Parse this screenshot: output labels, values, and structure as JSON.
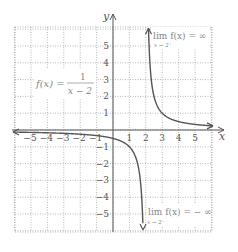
{
  "chart_data": {
    "type": "line",
    "title": "",
    "function": "f(x) = 1/(x-2)",
    "xlabel": "x",
    "ylabel": "y",
    "xlim": [
      -6,
      6
    ],
    "ylim": [
      -6,
      6
    ],
    "grid": true,
    "x_ticks": [
      -5,
      -4,
      -3,
      -2,
      -1,
      1,
      2,
      3,
      4,
      5
    ],
    "y_ticks": [
      -5,
      -4,
      -3,
      -2,
      -1,
      1,
      2,
      3,
      4,
      5
    ],
    "vertical_asymptote": 2,
    "horizontal_asymptote": 0,
    "series": [
      {
        "name": "left branch (x < 2)",
        "x": [
          -6,
          -5,
          -4,
          -3,
          -2,
          -1,
          0,
          1,
          1.5,
          1.8,
          1.83
        ],
        "y": [
          -0.125,
          -0.143,
          -0.167,
          -0.2,
          -0.25,
          -0.333,
          -0.5,
          -1,
          -2,
          -5,
          -6
        ]
      },
      {
        "name": "right branch (x > 2)",
        "x": [
          2.17,
          2.2,
          2.5,
          3,
          4,
          5,
          6
        ],
        "y": [
          6,
          5,
          2,
          1,
          0.5,
          0.333,
          0.25
        ]
      }
    ],
    "annotations": [
      {
        "text": "f(x) = 1/(x − 2)",
        "position": "left-upper"
      },
      {
        "text": "lim f(x) = ∞ as x → 2⁺",
        "position": "right-upper"
      },
      {
        "text": "lim f(x) = −∞ as x → 2⁻",
        "position": "right-lower"
      }
    ]
  },
  "labels": {
    "x_axis": "x",
    "y_axis": "y",
    "func_lhs": "f(x) =",
    "func_num": "1",
    "func_den": "x − 2",
    "lim_top": "lim f(x) = ∞",
    "lim_top_sub": "x → 2⁺",
    "lim_bot": "lim f(x) = − ∞",
    "lim_bot_sub": "x → 2⁻"
  },
  "colors": {
    "curve": "#555555",
    "axis": "#555555",
    "grid": "#999999"
  }
}
